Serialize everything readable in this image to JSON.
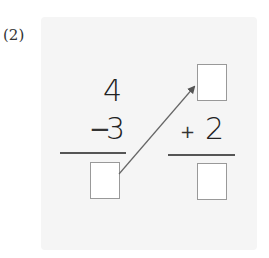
{
  "problem": {
    "number_label": "(2)",
    "left": {
      "top_number": "4",
      "operator": "−",
      "operand": "3",
      "answer": ""
    },
    "right": {
      "top_answer": "",
      "operator": "+",
      "operand": "2",
      "answer": ""
    },
    "arrow": {
      "from": "left-answer-box",
      "to": "right-top-box"
    }
  },
  "colors": {
    "panel": "#f5f5f5",
    "box_border": "#999999",
    "text": "#222222",
    "arrow": "#555555"
  }
}
